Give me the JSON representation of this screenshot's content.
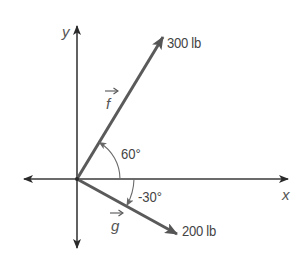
{
  "diagram": {
    "type": "vector-diagram",
    "axes": {
      "x_label": "x",
      "y_label": "y"
    },
    "vectors": [
      {
        "name": "f",
        "label": "f",
        "magnitude_label": "300 lb",
        "angle_label": "60°",
        "angle_deg": 60
      },
      {
        "name": "g",
        "label": "g",
        "magnitude_label": "200 lb",
        "angle_label": "-30°",
        "angle_deg": -30
      }
    ],
    "colors": {
      "axis": "#3a3a3a",
      "vector": "#5a5a5a",
      "arc": "#6a6a6a",
      "text": "#444444"
    }
  }
}
